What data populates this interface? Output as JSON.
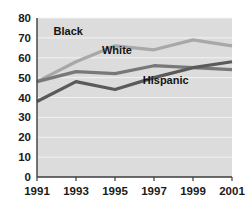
{
  "chart_data": {
    "type": "line",
    "title": "",
    "subtitle": "",
    "xlabel": "",
    "ylabel": "",
    "x": [
      1991,
      1993,
      1995,
      1997,
      1999,
      2001
    ],
    "categories": [
      "1991",
      "1993",
      "1995",
      "1997",
      "1999",
      "2001"
    ],
    "xlim": [
      1991,
      2001
    ],
    "ylim": [
      0,
      80
    ],
    "yticks": [
      0,
      10,
      20,
      30,
      40,
      50,
      60,
      70,
      80
    ],
    "ytick_labels": [
      "0",
      "10",
      "20",
      "30",
      "40",
      "50",
      "60",
      "70",
      "80"
    ],
    "xtick_labels": [
      "1991",
      "1993",
      "1995",
      "1997",
      "1999",
      "2001"
    ],
    "grid": "horizontal",
    "legend_position": "inline-labels",
    "plot_background": "#dcdcdc",
    "gridline_color": "#f2f2f2",
    "series": [
      {
        "name": "Black",
        "color": "#a8a8a8",
        "values": [
          48,
          58,
          66,
          64,
          69,
          66
        ],
        "label": "Black"
      },
      {
        "name": "White",
        "color": "#787878",
        "values": [
          48,
          53,
          52,
          56,
          55,
          54
        ],
        "label": "White"
      },
      {
        "name": "Hispanic",
        "color": "#5a5a5a",
        "values": [
          38,
          48,
          44,
          50,
          55,
          58
        ],
        "label": "Hispanic"
      }
    ],
    "annotations": [
      {
        "text": "Black",
        "x": 1992.6,
        "y": 71.5
      },
      {
        "text": "White",
        "x": 1995.1,
        "y": 62.0
      },
      {
        "text": "Hispanic",
        "x": 1997.6,
        "y": 47.0
      }
    ]
  }
}
